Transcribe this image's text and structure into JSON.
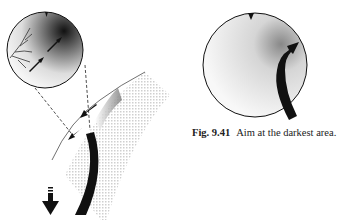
{
  "caption": {
    "label": "Fig. 9.41",
    "text": "Aim at the darkest area."
  },
  "figures": {
    "left": {
      "description": "Magnified circular detail of a skin area with shading, branching vessel lines and two arrows, connected by dashed lines to a curved surface with a stipple-shaded region and a black curved tool; down arrow at bottom-left",
      "icons": [
        "magnifier-circle",
        "vessel-branches",
        "arrow-up-right",
        "arrow-down-left",
        "curved-tool",
        "arrow-down"
      ]
    },
    "right": {
      "description": "Circular view with a notch at top, darker shading toward upper right, and a black curved arrow pointing into the darkest area",
      "icons": [
        "view-circle",
        "top-notch",
        "curved-arrow"
      ]
    }
  },
  "colors": {
    "ink": "#111111",
    "shade": "#888888",
    "grid": "#cfcfcf"
  }
}
